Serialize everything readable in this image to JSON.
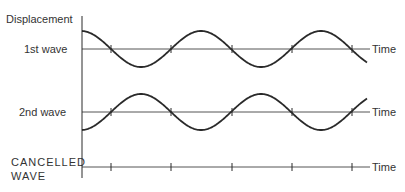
{
  "labels": {
    "y_axis": "Displacement",
    "wave1": "1st wave",
    "wave2": "2nd wave",
    "cancelled_line1": "CANCELLED",
    "cancelled_line2": "WAVE",
    "time1": "Time",
    "time2": "Time",
    "time3": "Time"
  },
  "diagram": {
    "axis_x": 82,
    "axis_top": 16,
    "axis_bottom": 178,
    "baseline_end": 370,
    "amplitude": 18,
    "period": 120,
    "phase_x": 81,
    "wave_end_x": 367,
    "tick_positions": [
      111,
      171,
      232,
      292,
      352
    ],
    "rows": [
      {
        "name": "wave1",
        "baseline_y": 49,
        "sign": -1
      },
      {
        "name": "wave2",
        "baseline_y": 112,
        "sign": 1
      },
      {
        "name": "cancelled",
        "baseline_y": 167,
        "sign": 0
      }
    ],
    "stroke_color": "#2a2a2a"
  }
}
